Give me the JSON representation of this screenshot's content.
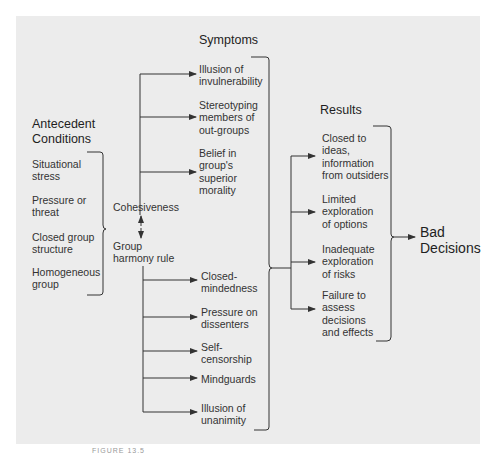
{
  "diagram": {
    "antecedent": {
      "title": "Antecedent\nConditions",
      "items": [
        "Situational\nstress",
        "Pressure or\nthreat",
        "Closed group\nstructure",
        "Homogeneous\ngroup"
      ]
    },
    "core": {
      "cohesiveness": "Cohesiveness",
      "harmony": "Group\nharmony rule"
    },
    "symptoms": {
      "title": "Symptoms",
      "items": [
        "Illusion of\ninvulnerability",
        "Stereotyping\nmembers of\nout-groups",
        "Belief in\ngroup's\nsuperior\nmorality",
        "Closed-\nmindedness",
        "Pressure on\ndissenters",
        "Self-\ncensorship",
        "Mindguards",
        "Illusion of\nunanimity"
      ]
    },
    "results": {
      "title": "Results",
      "items": [
        "Closed to\nideas,\ninformation\nfrom outsiders",
        "Limited\nexploration\nof options",
        "Inadequate\nexploration\nof risks",
        "Failure to\nassess\ndecisions\nand effects"
      ]
    },
    "outcome": "Bad\nDecisions",
    "caption": "FIGURE 13.5"
  }
}
